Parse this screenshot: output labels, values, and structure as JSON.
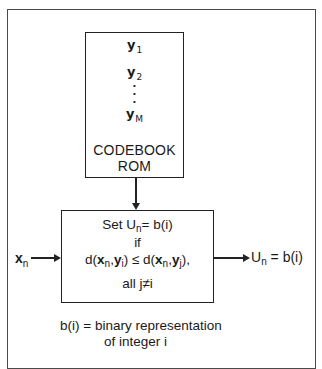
{
  "diagram": {
    "type": "block-diagram",
    "codebook": {
      "vectors": [
        {
          "symbol": "y",
          "subscript": "1"
        },
        {
          "symbol": "y",
          "subscript": "2"
        },
        {
          "symbol": "y",
          "subscript": "M"
        }
      ],
      "ellipsis": ".",
      "label_line1": "CODEBOOK",
      "label_line2": "ROM"
    },
    "decision": {
      "line1_prefix": "Set U",
      "line1_sub": "n",
      "line1_suffix": "= b(i)",
      "line2": "if",
      "line3": {
        "d_open": "d(",
        "x": "x",
        "x_sub": "n",
        "comma": ",",
        "y": "y",
        "yi_sub": "i",
        "close_le": ") ≤ d(",
        "yj_sub": "j",
        "close_end": "),"
      },
      "line4": "all j≠i"
    },
    "input": {
      "symbol": "x",
      "subscript": "n"
    },
    "output": {
      "prefix": "U",
      "subscript": "n",
      "suffix": " = b(i)"
    },
    "footnote": {
      "line1": "b(i) = binary representation",
      "line2": "of integer i"
    },
    "colors": {
      "line": "#222222",
      "frame": "#4a4a4a",
      "background": "#ffffff"
    }
  }
}
